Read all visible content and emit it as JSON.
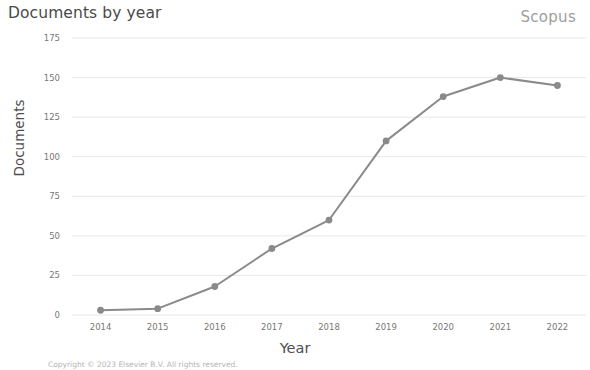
{
  "header": {
    "title": "Documents by year",
    "brand": "Scopus"
  },
  "footer": {
    "copyright": "Copyright © 2023 Elsevier B.V. All rights reserved."
  },
  "colors": {
    "line": "#8a8a8a",
    "marker": "#8a8a8a",
    "grid": "#e8e8e8",
    "axis_text": "#777777",
    "title_text": "#4a4a4a",
    "brand_text": "#9d9d9d"
  },
  "chart_data": {
    "type": "line",
    "title": "Documents by year",
    "xlabel": "Year",
    "ylabel": "Documents",
    "categories": [
      "2014",
      "2015",
      "2016",
      "2017",
      "2018",
      "2019",
      "2020",
      "2021",
      "2022"
    ],
    "values": [
      3,
      4,
      18,
      42,
      60,
      110,
      138,
      150,
      145
    ],
    "series": [
      {
        "name": "Documents",
        "values": [
          3,
          4,
          18,
          42,
          60,
          110,
          138,
          150,
          145
        ]
      }
    ],
    "ylim": [
      0,
      175
    ],
    "yticks": [
      0,
      25,
      50,
      75,
      100,
      125,
      150,
      175
    ],
    "ytick_labels": [
      "0",
      "25",
      "50",
      "75",
      "100",
      "125",
      "150",
      "175"
    ],
    "xtick_labels": [
      "2014",
      "2015",
      "2016",
      "2017",
      "2018",
      "2019",
      "2020",
      "2021",
      "2022"
    ],
    "grid": true,
    "grid_axis": "y",
    "legend": false,
    "marker": "circle"
  }
}
